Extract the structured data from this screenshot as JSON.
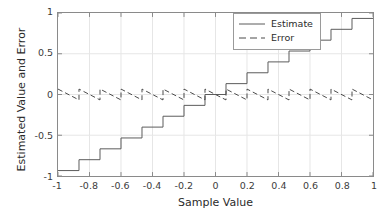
{
  "chart_data": {
    "type": "line",
    "title": "",
    "xlabel": "Sample Value",
    "ylabel": "Estimated Value and Error",
    "xlim": [
      -1,
      1
    ],
    "ylim": [
      -1,
      1
    ],
    "xticks": [
      -1,
      -0.8,
      -0.6,
      -0.4,
      -0.2,
      0,
      0.2,
      0.4,
      0.6,
      0.8,
      1
    ],
    "xticklabels": [
      "-1",
      "-0.8",
      "-0.6",
      "-0.4",
      "-0.2",
      "0",
      "0.2",
      "0.4",
      "0.6",
      "0.8",
      "1"
    ],
    "yticks": [
      -1,
      -0.5,
      0,
      0.5,
      1
    ],
    "yticklabels": [
      "-1",
      "-0.5",
      "0",
      "0.5",
      "1"
    ],
    "grid": true,
    "legend_position": "upper right",
    "quantizer": {
      "levels": 15,
      "step": 0.1333,
      "level_values": [
        -0.9333,
        -0.8,
        -0.6667,
        -0.5333,
        -0.4,
        -0.2667,
        -0.1333,
        0,
        0.1333,
        0.2667,
        0.4,
        0.5333,
        0.6667,
        0.8,
        0.9333
      ],
      "edges": [
        -1,
        -0.8667,
        -0.7333,
        -0.6,
        -0.4667,
        -0.3333,
        -0.2,
        -0.0667,
        0.0667,
        0.2,
        0.3333,
        0.4667,
        0.6,
        0.7333,
        0.8667,
        1
      ]
    },
    "series": [
      {
        "name": "Estimate",
        "style": "solid",
        "color": "#5a5a5a",
        "description": "Staircase quantized output versus input sample value",
        "x": [
          -1,
          -0.8667,
          -0.8667,
          -0.7333,
          -0.7333,
          -0.6,
          -0.6,
          -0.4667,
          -0.4667,
          -0.3333,
          -0.3333,
          -0.2,
          -0.2,
          -0.0667,
          -0.0667,
          0.0667,
          0.0667,
          0.2,
          0.2,
          0.3333,
          0.3333,
          0.4667,
          0.4667,
          0.6,
          0.6,
          0.7333,
          0.7333,
          0.8667,
          0.8667,
          1
        ],
        "y": [
          -0.9333,
          -0.9333,
          -0.8,
          -0.8,
          -0.6667,
          -0.6667,
          -0.5333,
          -0.5333,
          -0.4,
          -0.4,
          -0.2667,
          -0.2667,
          -0.1333,
          -0.1333,
          0,
          0,
          0.1333,
          0.1333,
          0.2667,
          0.2667,
          0.4,
          0.4,
          0.5333,
          0.5333,
          0.6667,
          0.6667,
          0.8,
          0.8,
          0.9333,
          0.9333
        ]
      },
      {
        "name": "Error",
        "style": "dashed",
        "color": "#4a4a4a",
        "description": "Sawtooth quantization error (estimate minus sample value)",
        "x": [
          -1,
          -0.8667,
          -0.8667,
          -0.7333,
          -0.7333,
          -0.6,
          -0.6,
          -0.4667,
          -0.4667,
          -0.3333,
          -0.3333,
          -0.2,
          -0.2,
          -0.0667,
          -0.0667,
          0.0667,
          0.0667,
          0.2,
          0.2,
          0.3333,
          0.3333,
          0.4667,
          0.4667,
          0.6,
          0.6,
          0.7333,
          0.7333,
          0.8667,
          0.8667,
          1
        ],
        "y": [
          0.0667,
          -0.0667,
          0.0667,
          -0.0667,
          0.0667,
          -0.0667,
          0.0667,
          -0.0667,
          0.0667,
          -0.0667,
          0.0667,
          -0.0667,
          0.0667,
          -0.0667,
          0.0667,
          -0.0667,
          0.0667,
          -0.0667,
          0.0667,
          -0.0667,
          0.0667,
          -0.0667,
          0.0667,
          -0.0667,
          0.0667,
          -0.0667,
          0.0667,
          -0.0667,
          0.0667,
          -0.0667
        ]
      }
    ]
  },
  "legend": {
    "items": [
      {
        "label": "Estimate",
        "style": "solid"
      },
      {
        "label": "Error",
        "style": "dashed"
      }
    ]
  },
  "colors": {
    "axis": "#8a8a8a",
    "grid": "#e6e6e6",
    "estimate": "#5a5a5a",
    "error": "#4a4a4a",
    "text": "#2b2b2b",
    "background": "#ffffff"
  }
}
